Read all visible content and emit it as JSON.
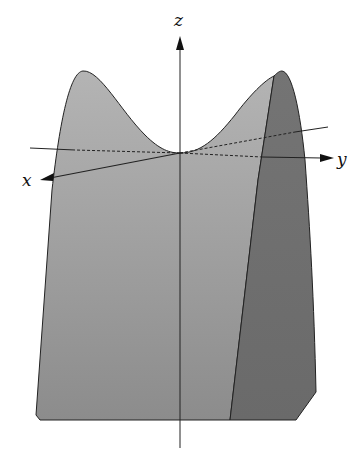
{
  "figure": {
    "axes": {
      "x_label": "x",
      "y_label": "y",
      "z_label": "z"
    },
    "colors": {
      "front_face": "#a8a8a8",
      "front_face_bottom": "#8f8f8f",
      "side_face": "#6e6e6e",
      "axis": "#111111",
      "background": "#ffffff"
    }
  }
}
